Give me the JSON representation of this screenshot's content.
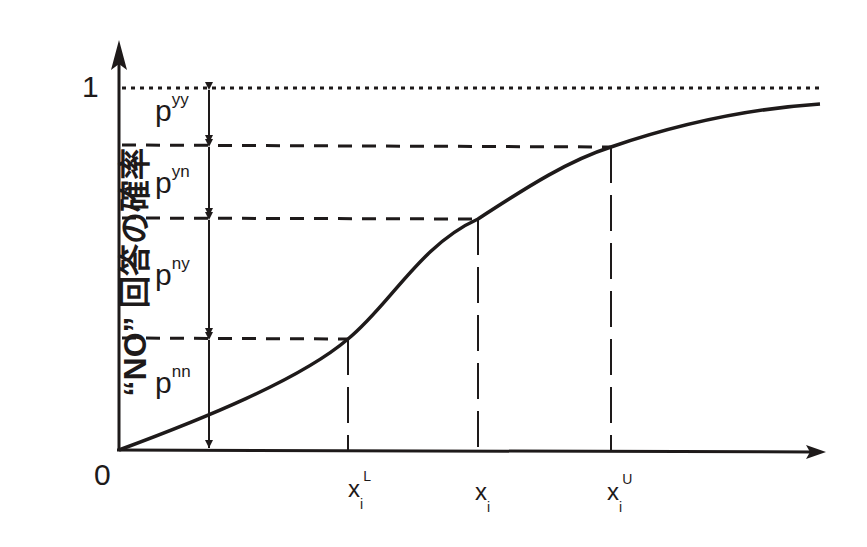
{
  "diagram": {
    "type": "cumulative probability curve (S-shaped)",
    "y_axis_label": "“NO” 回答の確率",
    "y_ticks": {
      "top": "1",
      "origin": "0"
    },
    "x_ticks": [
      {
        "id": "xL",
        "base": "x",
        "sub": "i",
        "sup": "L"
      },
      {
        "id": "x",
        "base": "x",
        "sub": "i",
        "sup": ""
      },
      {
        "id": "xU",
        "base": "x",
        "sub": "i",
        "sup": "U"
      }
    ],
    "segments": [
      {
        "base": "p",
        "sup": "yy"
      },
      {
        "base": "p",
        "sup": "yn"
      },
      {
        "base": "p",
        "sup": "ny"
      },
      {
        "base": "p",
        "sup": "nn"
      }
    ],
    "colors": {
      "ink": "#1e1a1a",
      "background": "#ffffff"
    }
  }
}
